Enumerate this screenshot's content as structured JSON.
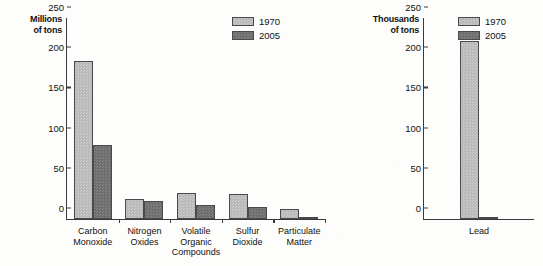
{
  "chart_data": [
    {
      "type": "bar",
      "title": "",
      "ylabel": "Millions\nof tons",
      "xlabel": "",
      "ylim": [
        0,
        250
      ],
      "yticks": [
        0,
        50,
        100,
        150,
        200,
        250
      ],
      "grid": false,
      "legend_position": "top-right",
      "categories": [
        "Carbon\nMonoxide",
        "Nitrogen\nOxides",
        "Volatile\nOrganic\nCompounds",
        "Sulfur\nDioxide",
        "Particulate\nMatter"
      ],
      "series": [
        {
          "name": "1970",
          "values": [
            197,
            25,
            32,
            31,
            13
          ],
          "color": "#b9b9b9"
        },
        {
          "name": "2005",
          "values": [
            92,
            23,
            17,
            15,
            2
          ],
          "color": "#6e6e6e"
        }
      ]
    },
    {
      "type": "bar",
      "title": "",
      "ylabel": "Thousands\nof tons",
      "xlabel": "",
      "ylim": [
        0,
        250
      ],
      "yticks": [
        0,
        50,
        100,
        150,
        200,
        250
      ],
      "grid": false,
      "legend_position": "top-right",
      "categories": [
        "Lead"
      ],
      "series": [
        {
          "name": "1970",
          "values": [
            221
          ],
          "color": "#b9b9b9"
        },
        {
          "name": "2005",
          "values": [
            3
          ],
          "color": "#6e6e6e"
        }
      ]
    }
  ],
  "colors": {
    "series_1970": "#b9b9b9",
    "series_2005": "#6e6e6e",
    "axis": "#3a3a3a",
    "text": "#111111",
    "background": "#fdfdfb"
  }
}
